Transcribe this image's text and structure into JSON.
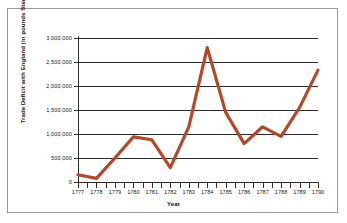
{
  "chart_data": {
    "type": "line",
    "title": "",
    "xlabel": "Year",
    "ylabel": "Trade Deficit with England (in pounds Sterling)",
    "categories": [
      "1777",
      "1778",
      "1779",
      "1780",
      "1781",
      "1782",
      "1783",
      "1784",
      "1785",
      "1786",
      "1787",
      "1788",
      "1789",
      "1790"
    ],
    "x": [
      1777,
      1778,
      1779,
      1780,
      1781,
      1782,
      1783,
      1784,
      1785,
      1786,
      1787,
      1788,
      1789,
      1790
    ],
    "values": [
      150000,
      75000,
      500000,
      940000,
      880000,
      300000,
      1150000,
      2800000,
      1450000,
      800000,
      1150000,
      950000,
      1550000,
      2330000
    ],
    "series": [
      {
        "name": "Trade Deficit with England",
        "values": [
          150000,
          75000,
          500000,
          940000,
          880000,
          300000,
          1150000,
          2800000,
          1450000,
          800000,
          1150000,
          950000,
          1550000,
          2330000
        ]
      }
    ],
    "ylim": [
      0,
      3000000
    ],
    "xlim": [
      1777,
      1790
    ],
    "ytick_labels": [
      "3,000,000",
      "2,500,000",
      "2,000,000",
      "1,500,000",
      "1,000,000",
      "500,000",
      "0"
    ],
    "ytick_values": [
      3000000,
      2500000,
      2000000,
      1500000,
      1000000,
      500000,
      0
    ],
    "grid": true,
    "legend": false,
    "legend_position": "none",
    "line_color": "#B5482B",
    "grid_color": "#2b2b2b",
    "axis_color": "#2b2b2b",
    "background": "#ffffff",
    "border_color": "#9a9a9a"
  }
}
